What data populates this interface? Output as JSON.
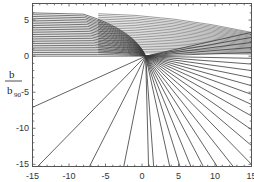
{
  "chart_data": {
    "type": "line",
    "title": "",
    "xlabel": "",
    "ylabel": "b / b_90",
    "ylabel_numerator": "b",
    "ylabel_denominator": "b",
    "ylabel_denominator_sub": "90",
    "xlim": [
      -15,
      15
    ],
    "ylim": [
      -15.3,
      7.3
    ],
    "x_ticks": [
      -15,
      -10,
      -5,
      0,
      5,
      10,
      15
    ],
    "y_ticks": [
      5,
      0,
      -5,
      -10,
      -15
    ],
    "grid": false,
    "legend": null,
    "focus": {
      "x": 0.5,
      "y": 0.0
    },
    "incoming_heights": [
      0.0,
      0.25,
      0.5,
      0.75,
      1.0,
      1.25,
      1.5,
      1.75,
      2.0,
      2.25,
      2.5,
      2.75,
      3.0,
      3.25,
      3.5,
      3.75,
      4.0,
      4.25,
      4.5,
      4.75,
      5.0,
      5.25,
      5.5,
      5.75,
      6.0
    ],
    "outgoing_endpoints": [
      {
        "x": 15,
        "y": 3.3
      },
      {
        "x": 15,
        "y": 2.6
      },
      {
        "x": 15,
        "y": 1.9
      },
      {
        "x": 15,
        "y": 1.2
      },
      {
        "x": 15,
        "y": 0.5
      },
      {
        "x": 15,
        "y": -0.3
      },
      {
        "x": 15,
        "y": -1.1
      },
      {
        "x": 15,
        "y": -2.0
      },
      {
        "x": 15,
        "y": -3.0
      },
      {
        "x": 15,
        "y": -4.1
      },
      {
        "x": 15,
        "y": -5.3
      },
      {
        "x": 15,
        "y": -6.7
      },
      {
        "x": 15,
        "y": -8.3
      },
      {
        "x": 15,
        "y": -10.2
      },
      {
        "x": 15,
        "y": -12.4
      },
      {
        "x": 15,
        "y": -15.0
      },
      {
        "x": 12.5,
        "y": -15.3
      },
      {
        "x": 10.3,
        "y": -15.3
      },
      {
        "x": 8.4,
        "y": -15.3
      },
      {
        "x": 6.7,
        "y": -15.3
      },
      {
        "x": 5.2,
        "y": -15.3
      },
      {
        "x": 3.8,
        "y": -15.3
      },
      {
        "x": 1.6,
        "y": -15.3
      },
      {
        "x": 0.9,
        "y": -15.3
      },
      {
        "x": -2.5,
        "y": -15.3
      },
      {
        "x": -7.2,
        "y": -15.3
      },
      {
        "x": -14.3,
        "y": -15.3
      },
      {
        "x": -15,
        "y": -7.1
      }
    ]
  },
  "colors": {
    "line": "#3a3a3a",
    "frame": "#555555",
    "background": "#ffffff"
  }
}
